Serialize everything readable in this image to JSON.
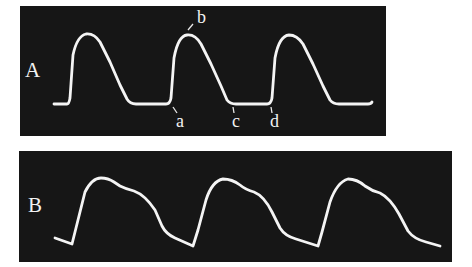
{
  "figure": {
    "panels": [
      {
        "id": "A",
        "label": "A",
        "description": "Square-topped periodic waveform with flat baseline",
        "point_labels": {
          "a": "a",
          "b": "b",
          "c": "c",
          "d": "d"
        }
      },
      {
        "id": "B",
        "label": "B",
        "description": "Periodic pulse waveform with dicrotic shoulder on descending limb"
      }
    ],
    "colors": {
      "background": "#ffffff",
      "panel": "#161616",
      "trace": "#f4f4f4"
    }
  }
}
